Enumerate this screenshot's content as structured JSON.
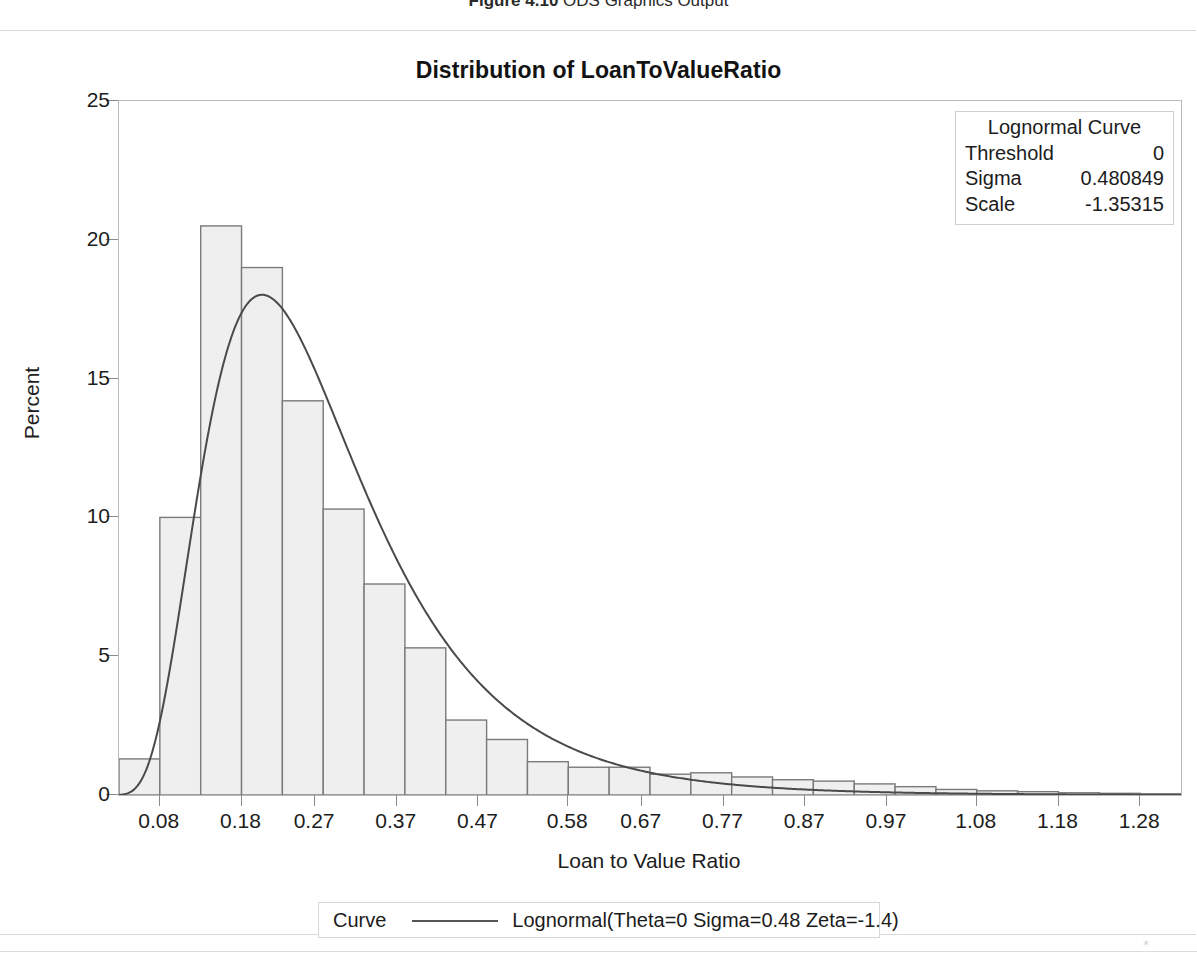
{
  "page": {
    "caption_figure": "Figure 4.10",
    "caption_text": "ODS Graphics Output"
  },
  "chart_title": "Distribution of LoanToValueRatio",
  "inset": {
    "title": "Lognormal Curve",
    "rows": [
      {
        "key": "Threshold",
        "value": "0"
      },
      {
        "key": "Sigma",
        "value": "0.480849"
      },
      {
        "key": "Scale",
        "value": "-1.35315"
      }
    ]
  },
  "legend": {
    "group_label": "Curve",
    "entry_label": "Lognormal(Theta=0 Sigma=0.48 Zeta=-1.4)"
  },
  "colors": {
    "bar_fill": "#efefef",
    "bar_stroke": "#7a7a7a",
    "curve": "#4a4a4a",
    "axis": "#9a9a9a",
    "frame": "#b9b9b9",
    "text": "#1c1c1c"
  },
  "chart_data": {
    "type": "bar",
    "subtype": "histogram-with-fitted-curve",
    "title": "Distribution of LoanToValueRatio",
    "xlabel": "Loan to Value Ratio",
    "ylabel": "Percent",
    "xlim": [
      0.03,
      1.33
    ],
    "ylim": [
      0,
      25
    ],
    "grid": false,
    "legend_position": "bottom",
    "xticks": [
      0.08,
      0.18,
      0.27,
      0.37,
      0.47,
      0.58,
      0.67,
      0.77,
      0.87,
      0.97,
      1.08,
      1.18,
      1.28
    ],
    "xtick_labels": [
      "0.08",
      "0.18",
      "0.27",
      "0.37",
      "0.47",
      "0.58",
      "0.67",
      "0.77",
      "0.87",
      "0.97",
      "1.08",
      "1.18",
      "1.28"
    ],
    "yticks": [
      0,
      5,
      10,
      15,
      20,
      25
    ],
    "ytick_labels": [
      "0",
      "5",
      "10",
      "15",
      "20",
      "25"
    ],
    "bin_width": 0.05,
    "bin_centers": [
      0.055,
      0.105,
      0.155,
      0.205,
      0.255,
      0.305,
      0.355,
      0.405,
      0.455,
      0.505,
      0.555,
      0.605,
      0.655,
      0.705,
      0.755,
      0.805,
      0.855,
      0.905,
      0.955,
      1.005,
      1.055,
      1.105,
      1.155,
      1.205,
      1.255,
      1.305
    ],
    "values": [
      1.3,
      10.0,
      20.5,
      19.0,
      14.2,
      10.3,
      7.6,
      5.3,
      2.7,
      2.0,
      1.2,
      1.0,
      1.0,
      0.75,
      0.8,
      0.65,
      0.55,
      0.5,
      0.4,
      0.3,
      0.2,
      0.15,
      0.12,
      0.08,
      0.06,
      0.04
    ],
    "series": [
      {
        "name": "Lognormal(Theta=0 Sigma=0.48 Zeta=-1.4)",
        "type": "line",
        "theta": 0,
        "sigma": 0.480849,
        "zeta": -1.35315,
        "scale_percent_factor": 5.0
      }
    ],
    "annotations": {
      "lognormal_curve": {
        "Threshold": "0",
        "Sigma": "0.480849",
        "Scale": "-1.35315"
      }
    }
  }
}
